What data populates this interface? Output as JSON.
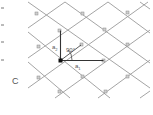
{
  "diagram": {
    "panel_label": "C",
    "labels": {
      "a1": "a",
      "a1_sub": "1",
      "a2": "a",
      "a2_sub": "2",
      "angle": "90°"
    },
    "colors": {
      "lattice_line": "#9a9a9a",
      "vector": "#333333",
      "node": "#bdbdbd",
      "origin": "#111111",
      "text": "#555555"
    }
  }
}
